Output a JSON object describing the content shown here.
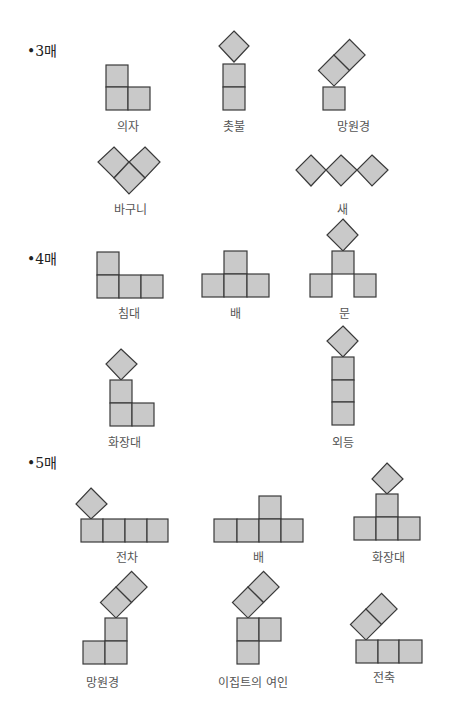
{
  "sections": [
    {
      "label": "•3매",
      "figures": [
        {
          "name": "의자"
        },
        {
          "name": "촛불"
        },
        {
          "name": "망원경"
        },
        {
          "name": "바구니"
        },
        {
          "name": "새"
        }
      ]
    },
    {
      "label": "•4매",
      "figures": [
        {
          "name": "침대"
        },
        {
          "name": "배"
        },
        {
          "name": "문"
        },
        {
          "name": "화장대"
        },
        {
          "name": "외등"
        }
      ]
    },
    {
      "label": "•5매",
      "figures": [
        {
          "name": "전차"
        },
        {
          "name": "배"
        },
        {
          "name": "화장대"
        },
        {
          "name": "망원경"
        },
        {
          "name": "이집트의 여인"
        },
        {
          "name": "전축"
        }
      ]
    }
  ],
  "colors": {
    "tile_fill": "#c9c9c9",
    "tile_stroke": "#3a3a3a"
  }
}
